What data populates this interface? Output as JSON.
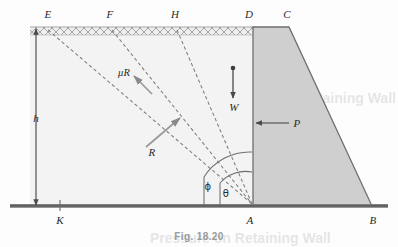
{
  "figure": {
    "caption": "Fig. 18.20",
    "title_alt": "Retaining wall with trial failure wedges",
    "colors": {
      "background": "#fdfdfd",
      "soil_fill": "#f2f2f2",
      "wall_fill": "#cfcfcf",
      "line": "#555555",
      "dash": "#777777",
      "ground": "#6b6b6b",
      "hatch": "#909090",
      "text": "#2a2a2a",
      "caption": "#9a9a9a"
    },
    "points": [
      {
        "label": "E",
        "x": 48,
        "y": 14,
        "node_x": 48,
        "node_y": 30
      },
      {
        "label": "F",
        "x": 110,
        "y": 14,
        "node_x": 112,
        "node_y": 30
      },
      {
        "label": "H",
        "x": 175,
        "y": 14,
        "node_x": 177,
        "node_y": 30
      },
      {
        "label": "D",
        "x": 249,
        "y": 14,
        "node_x": 253,
        "node_y": 27
      },
      {
        "label": "C",
        "x": 287,
        "y": 14,
        "node_x": 289,
        "node_y": 27
      },
      {
        "label": "K",
        "x": 60,
        "y": 220,
        "node_x": 60,
        "node_y": 206
      },
      {
        "label": "A",
        "x": 250,
        "y": 220,
        "node_x": 252,
        "node_y": 206
      },
      {
        "label": "B",
        "x": 373,
        "y": 220,
        "node_x": 372,
        "node_y": 206
      }
    ],
    "force_labels": [
      {
        "name": "mu-R",
        "text": "μR",
        "x": 124,
        "y": 72,
        "kind": "friction-force"
      },
      {
        "name": "R",
        "text": "R",
        "x": 152,
        "y": 152,
        "kind": "resultant-reaction"
      },
      {
        "name": "W",
        "text": "W",
        "x": 234,
        "y": 107,
        "kind": "weight"
      },
      {
        "name": "P",
        "text": "P",
        "x": 297,
        "y": 123,
        "kind": "active-thrust"
      }
    ],
    "angle_labels": [
      {
        "name": "phi",
        "text": "ϕ",
        "x": 208,
        "y": 186,
        "meaning": "angle-of-friction"
      },
      {
        "name": "theta",
        "text": "θ",
        "x": 224,
        "y": 192,
        "meaning": "failure-plane-angle"
      }
    ],
    "dimension_labels": [
      {
        "name": "h",
        "text": "h",
        "x": 36,
        "y": 118,
        "meaning": "wall-height"
      }
    ],
    "ghost_text": [
      {
        "text": "Retaining Wall",
        "x": 320,
        "y": 98,
        "size": "big"
      },
      {
        "text": "Pressure on Retaining Wall",
        "x": 255,
        "y": 236,
        "size": "big"
      },
      {
        "text": "the soil is in a state of",
        "x": 60,
        "y": 135,
        "size": "small"
      },
      {
        "text": "surface of the wedge",
        "x": 60,
        "y": 150,
        "size": "small"
      },
      {
        "text": "the resisting forces",
        "x": 60,
        "y": 165,
        "size": "small"
      },
      {
        "text": "wall is subjected to",
        "x": 110,
        "y": 60,
        "size": "small"
      },
      {
        "text": "the pressure acting",
        "x": 110,
        "y": 75,
        "size": "small"
      },
      {
        "text": "the magnitude of",
        "x": 110,
        "y": 90,
        "size": "small"
      }
    ]
  }
}
